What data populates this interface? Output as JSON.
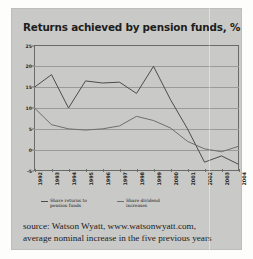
{
  "card": {
    "background_color": "#c9c9c7"
  },
  "title": "Returns achieved by pension funds, %",
  "legend": {
    "items": [
      {
        "label": "Share returns to pension funds",
        "color": "#4c4c4a"
      },
      {
        "label": "Share dividend increases",
        "color": "#6e6e6c"
      }
    ]
  },
  "source": {
    "line1": "source: Watson Wyatt, www.watsonwyatt.com,",
    "line2": "average nominal increase in the five previous years"
  },
  "chart_data": {
    "type": "line",
    "title": "Returns achieved by pension funds, %",
    "xlabel": "",
    "ylabel": "%",
    "ylim": [
      -5,
      25
    ],
    "yticks": [
      25,
      20,
      15,
      10,
      5,
      0,
      -5
    ],
    "ytick_labels": [
      "25",
      "20",
      "15",
      "10",
      "5",
      "0",
      "-5"
    ],
    "grid": true,
    "legend_position": "bottom",
    "categories": [
      "1992",
      "1993",
      "1994",
      "1995",
      "1996",
      "1997",
      "1998",
      "1999",
      "2000",
      "2001",
      "2002",
      "2003",
      "2004"
    ],
    "series": [
      {
        "name": "Share returns to pension funds",
        "color": "#4c4c4a",
        "values": [
          15.0,
          18.0,
          10.0,
          16.5,
          16.0,
          16.2,
          13.5,
          20.0,
          12.0,
          5.0,
          -3.0,
          -1.5,
          -3.5
        ]
      },
      {
        "name": "Share dividend increases",
        "color": "#6e6e6c",
        "values": [
          10.0,
          6.0,
          5.0,
          4.7,
          5.0,
          5.7,
          8.0,
          7.0,
          5.2,
          2.0,
          0.2,
          -0.5,
          0.8
        ]
      }
    ]
  }
}
